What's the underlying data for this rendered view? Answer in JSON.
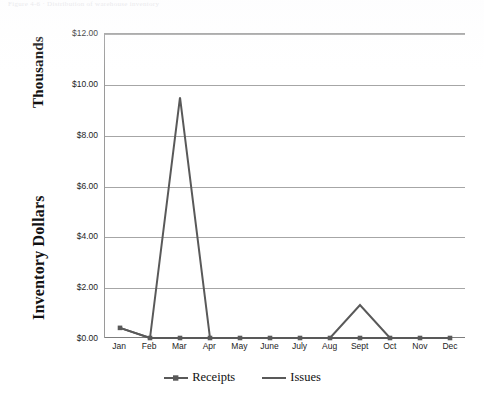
{
  "scan_header": {
    "text": "Figure 4-6 · Distribution of warehouse inventory"
  },
  "chart_data": {
    "type": "line",
    "title": "",
    "subtitle": "",
    "xlabel": "",
    "ylabel": "Inventory Dollars",
    "ylabel_secondary": "Thousands",
    "categories": [
      "Jan",
      "Feb",
      "Mar",
      "Apr",
      "May",
      "June",
      "July",
      "Aug",
      "Sept",
      "Oct",
      "Nov",
      "Dec"
    ],
    "series": [
      {
        "name": "Receipts",
        "marker": "square",
        "color": "#595959",
        "values": [
          0.4,
          0.0,
          0.0,
          0.0,
          0.0,
          0.0,
          0.0,
          0.0,
          0.0,
          0.0,
          0.0,
          0.0
        ]
      },
      {
        "name": "Issues",
        "marker": "none",
        "color": "#595959",
        "values": [
          0.4,
          0.0,
          9.5,
          0.0,
          0.0,
          0.0,
          0.0,
          0.0,
          1.3,
          0.0,
          0.0,
          0.0
        ]
      }
    ],
    "ylim": [
      0,
      12
    ],
    "ytick_values": [
      0,
      2,
      4,
      6,
      8,
      10,
      12
    ],
    "ytick_labels": [
      "$0.00",
      "$2.00",
      "$4.00",
      "$6.00",
      "$8.00",
      "$10.00",
      "$12.00"
    ],
    "units": "Thousands of Dollars",
    "grid": true,
    "grid_axis": "y",
    "legend_position": "bottom",
    "legend_entries": [
      "Receipts",
      "Issues"
    ],
    "annotations": []
  },
  "colors": {
    "series_line": "#595959",
    "gridline": "#a6a6a6",
    "axis": "#7d7d7d",
    "text": "#1d1d1d",
    "background": "#ffffff"
  }
}
